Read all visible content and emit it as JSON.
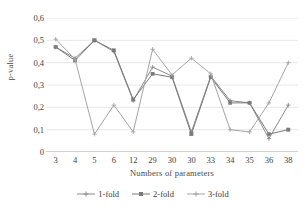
{
  "chart_data": {
    "type": "line",
    "title": "",
    "xlabel": "Numbers of parameters",
    "ylabel": "p-value",
    "categories": [
      "3",
      "4",
      "5",
      "6",
      "12",
      "29",
      "30",
      "30",
      "33",
      "34",
      "35",
      "36",
      "38"
    ],
    "ylim": [
      0,
      0.6
    ],
    "ytick_labels": [
      "0",
      "0,1",
      "0,2",
      "0,3",
      "0,4",
      "0,5",
      "0,6"
    ],
    "ytick_values": [
      0,
      0.1,
      0.2,
      0.3,
      0.4,
      0.5,
      0.6
    ],
    "grid": "horizontal",
    "legend_position": "bottom",
    "decimal_separator": ",",
    "series": [
      {
        "name": "1-fold",
        "marker": "cross",
        "color": "#8c8c8c",
        "values": [
          0.47,
          0.42,
          0.5,
          0.45,
          0.23,
          0.38,
          0.34,
          0.09,
          0.34,
          0.23,
          0.22,
          0.06,
          0.21
        ]
      },
      {
        "name": "2-fold",
        "marker": "square",
        "color": "#7a7a7a",
        "values": [
          0.47,
          0.41,
          0.5,
          0.455,
          0.235,
          0.35,
          0.335,
          0.08,
          0.335,
          0.22,
          0.22,
          0.08,
          0.1
        ]
      },
      {
        "name": "3-fold",
        "marker": "cross",
        "color": "#a5a5a5",
        "values": [
          0.505,
          0.415,
          0.08,
          0.21,
          0.09,
          0.46,
          0.345,
          0.42,
          0.35,
          0.1,
          0.09,
          0.22,
          0.4
        ]
      }
    ]
  },
  "legend": {
    "items": [
      {
        "label": "1-fold"
      },
      {
        "label": "2-fold"
      },
      {
        "label": "3-fold"
      }
    ]
  }
}
